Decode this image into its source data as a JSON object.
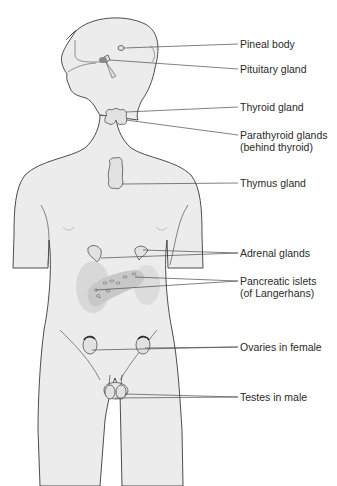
{
  "diagram": {
    "colors": {
      "body_fill": "#ececec",
      "outline": "#3a3a3a",
      "gland_fill": "#e2e2e2",
      "organ_fill": "#d6d6d6",
      "leader": "#4a4a4a",
      "text": "#2a2a2a"
    },
    "labels": [
      {
        "id": "pineal",
        "text": "Pineal body",
        "y": 44
      },
      {
        "id": "pituitary",
        "text": "Pituitary gland",
        "y": 69
      },
      {
        "id": "thyroid",
        "text": "Thyroid gland",
        "y": 107
      },
      {
        "id": "parathyroid",
        "text": "Parathyroid glands",
        "text2": "(behind thyroid)",
        "y": 135
      },
      {
        "id": "thymus",
        "text": "Thymus gland",
        "y": 183
      },
      {
        "id": "adrenal",
        "text": "Adrenal glands",
        "y": 253
      },
      {
        "id": "pancreas",
        "text": "Pancreatic islets",
        "text2": "(of Langerhans)",
        "y": 281
      },
      {
        "id": "ovaries",
        "text": "Ovaries in female",
        "y": 347
      },
      {
        "id": "testes",
        "text": "Testes in male",
        "y": 397
      }
    ]
  }
}
